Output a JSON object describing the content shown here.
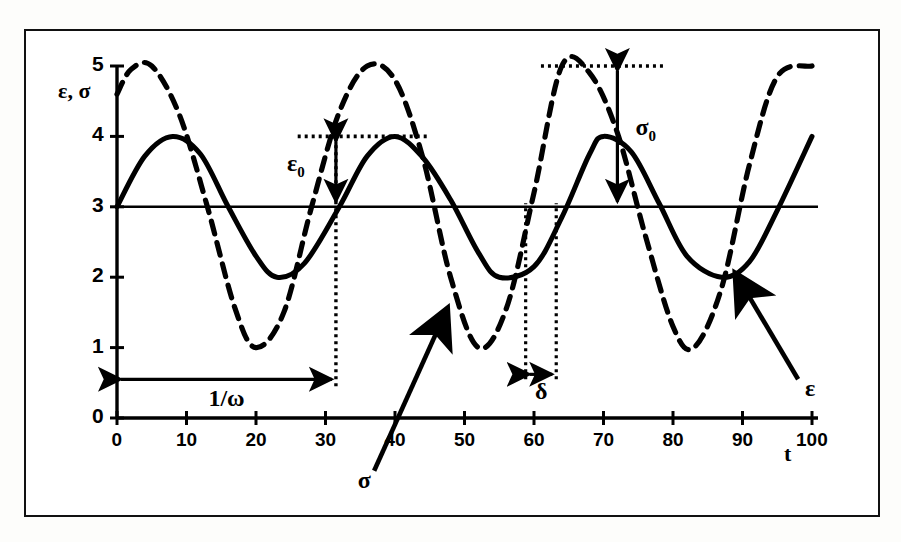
{
  "figure": {
    "background": "#ffffff",
    "frame_color": "#111111",
    "y_axis_label": "ε, σ",
    "x_axis_label": "t"
  },
  "chart_data": {
    "type": "line",
    "title": "",
    "xlabel": "t",
    "ylabel": "ε, σ",
    "xlim": [
      0,
      100
    ],
    "ylim": [
      0,
      5
    ],
    "xticks": [
      0,
      10,
      20,
      30,
      40,
      50,
      60,
      70,
      80,
      90,
      100
    ],
    "yticks": [
      0,
      1,
      2,
      3,
      4,
      5
    ],
    "grid": false,
    "legend": "none",
    "baseline": 3,
    "series": [
      {
        "name": "ε",
        "style": "solid",
        "color": "#000000",
        "mean": 3,
        "amplitude": 1,
        "period": 31.5,
        "phase_shift_deg": 0,
        "points_desc": "starts at 3 rising, peak 4 at t≈8, crosses 3 at t≈16, trough 2 at t≈23, crosses 3 at t≈32, peak 4 at t≈40, trough 2 at t≈55, peak 4 at t≈70, trough 2 at t≈87, ends at 4 at t=100",
        "x": [
          0,
          4,
          8,
          12,
          16,
          20,
          23,
          27,
          32,
          36,
          40,
          44,
          48,
          52,
          55,
          60,
          64,
          68,
          70,
          74,
          78,
          82,
          87,
          91,
          95,
          100
        ],
        "y": [
          3.0,
          3.72,
          4.0,
          3.75,
          3.0,
          2.3,
          2.0,
          2.2,
          3.0,
          3.72,
          4.0,
          3.7,
          3.1,
          2.35,
          2.0,
          2.15,
          2.85,
          3.75,
          4.0,
          3.78,
          3.05,
          2.3,
          2.0,
          2.22,
          2.95,
          4.0
        ]
      },
      {
        "name": "σ",
        "style": "dashed",
        "color": "#000000",
        "mean": 3,
        "amplitude": 2,
        "period": 31.5,
        "phase_shift_deg": 45,
        "points_desc": "starts at 4.6 rising, peak 5 at t≈5, crosses 3 at t≈13, trough 1 at t≈20, crosses 3 at t≈28, peak 5 at t≈36, trough 1 at t≈52, peak 5 at t≈64, trough 1 at t≈83, ends at 5 at t=100",
        "x": [
          0,
          2,
          5,
          9,
          13,
          17,
          20,
          24,
          28,
          32,
          36,
          40,
          44,
          48,
          52,
          56,
          60,
          64,
          68,
          72,
          76,
          80,
          83,
          87,
          91,
          95,
          100
        ],
        "y": [
          4.6,
          4.95,
          5.0,
          4.3,
          3.0,
          1.55,
          1.0,
          1.5,
          3.0,
          4.35,
          5.0,
          4.8,
          3.7,
          2.0,
          1.0,
          1.55,
          3.2,
          5.0,
          4.9,
          4.05,
          2.6,
          1.3,
          1.0,
          1.85,
          3.6,
          4.85,
          5.0
        ]
      }
    ],
    "annotations": [
      {
        "name": "epsilon-zero",
        "label": "ε",
        "sub": "0",
        "type": "double-arrow-vertical",
        "from_y": 4,
        "to_y": 3,
        "at_x": 31.5,
        "guide": {
          "type": "dotted-horizontal",
          "y": 4,
          "x_from": 26,
          "x_to": 45
        }
      },
      {
        "name": "sigma-zero",
        "label": "σ",
        "sub": "0",
        "type": "double-arrow-vertical",
        "from_y": 5,
        "to_y": 3,
        "at_x": 72,
        "guide": {
          "type": "dotted-horizontal",
          "y": 5,
          "x_from": 61,
          "x_to": 79
        }
      },
      {
        "name": "one-over-omega",
        "label": "1/ω",
        "type": "double-arrow-horizontal",
        "from_x": 0,
        "to_x": 31.5,
        "at_y": 0.55,
        "guide": {
          "type": "dotted-vertical",
          "x": 31.5,
          "y_from": 0.45,
          "y_to": 4.05
        }
      },
      {
        "name": "delta",
        "label": "δ",
        "type": "double-arrow-horizontal",
        "from_x": 58.8,
        "to_x": 63.2,
        "at_y": 0.62,
        "guides": [
          {
            "type": "dotted-vertical",
            "x": 58.8,
            "y_from": 0.55,
            "y_to": 3.05
          },
          {
            "type": "dotted-vertical",
            "x": 63.2,
            "y_from": 0.55,
            "y_to": 3.05
          }
        ]
      },
      {
        "name": "sigma-pointer",
        "label": "σ",
        "type": "arrow-callout",
        "label_x": 37,
        "label_y": -0.75,
        "tip_x": 47.5,
        "tip_y": 1.55
      },
      {
        "name": "epsilon-pointer",
        "label": "ε",
        "type": "arrow-callout",
        "label_x": 98,
        "label_y": 0.55,
        "tip_x": 89,
        "tip_y": 2.05
      }
    ]
  }
}
